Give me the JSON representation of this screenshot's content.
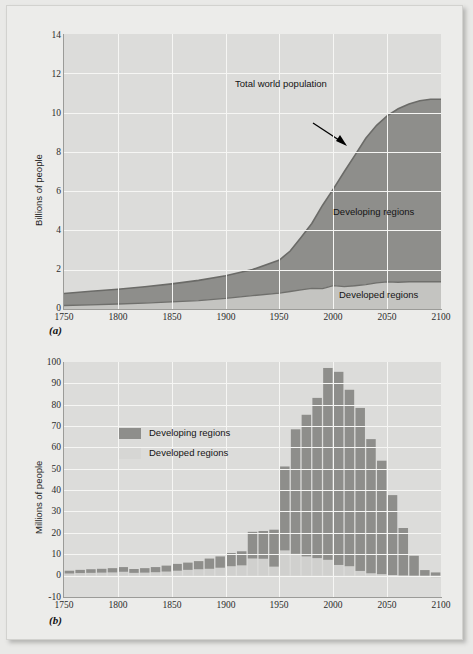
{
  "figure": {
    "background_color": "#e9e9e7",
    "panel_background": "#dcdcda",
    "gridline_color": "#f6f6f4",
    "developing_color": "#8e8e8b",
    "developed_color": "#d0d0ce",
    "line_color": "#6f6f6c"
  },
  "panel_a": {
    "label": "(a)",
    "ylabel": "Billions of people",
    "yticks": [
      "0",
      "2",
      "4",
      "6",
      "8",
      "10",
      "12",
      "14"
    ],
    "xticks": [
      "1750",
      "1800",
      "1850",
      "1900",
      "1950",
      "2000",
      "2050",
      "2100"
    ],
    "annotations": {
      "total": "Total world population",
      "developing": "Developing regions",
      "developed": "Developed regions"
    }
  },
  "panel_b": {
    "label": "(b)",
    "ylabel": "Millions of people",
    "yticks": [
      "-10",
      "0",
      "10",
      "20",
      "30",
      "40",
      "50",
      "60",
      "70",
      "80",
      "90",
      "100"
    ],
    "xticks": [
      "1750",
      "1800",
      "1850",
      "1900",
      "1950",
      "2000",
      "2050",
      "2100"
    ],
    "legend": [
      {
        "label": "Developing regions",
        "color": "#8e8e8b"
      },
      {
        "label": "Developed regions",
        "color": "#d0d0ce"
      }
    ]
  },
  "chart_data": [
    {
      "id": "panel_a",
      "type": "area",
      "stacked": true,
      "title": "",
      "xlabel": "",
      "ylabel": "Billions of people",
      "xlim": [
        1750,
        2100
      ],
      "ylim": [
        0,
        14
      ],
      "ytick_values": [
        0,
        2,
        4,
        6,
        8,
        10,
        12,
        14
      ],
      "xtick_values": [
        1750,
        1800,
        1850,
        1900,
        1950,
        2000,
        2050,
        2100
      ],
      "grid": true,
      "legend": "none",
      "annotations": [
        {
          "text": "Total world population",
          "x": 2000,
          "y": 11.9,
          "arrow_to_x": 2018,
          "arrow_to_y": 10.0
        },
        {
          "text": "Developing regions",
          "x": 2035,
          "y": 5.0
        },
        {
          "text": "Developed regions",
          "x": 2045,
          "y": 0.6
        }
      ],
      "x": [
        1750,
        1775,
        1800,
        1825,
        1850,
        1875,
        1900,
        1925,
        1950,
        1960,
        1970,
        1980,
        1990,
        2000,
        2010,
        2020,
        2030,
        2040,
        2050,
        2060,
        2070,
        2080,
        2090,
        2100
      ],
      "series": [
        {
          "name": "Developed regions",
          "values": [
            0.18,
            0.21,
            0.25,
            0.3,
            0.36,
            0.43,
            0.54,
            0.68,
            0.81,
            0.89,
            0.97,
            1.05,
            1.14,
            1.19,
            1.24,
            1.29,
            1.33,
            1.36,
            1.38,
            1.39,
            1.39,
            1.39,
            1.39,
            1.39
          ]
        },
        {
          "name": "Developing regions",
          "values": [
            0.61,
            0.69,
            0.76,
            0.83,
            0.92,
            1.03,
            1.16,
            1.33,
            1.69,
            2.07,
            2.68,
            3.31,
            4.15,
            4.93,
            5.75,
            6.55,
            7.37,
            8.0,
            8.47,
            8.81,
            9.05,
            9.22,
            9.3,
            9.3
          ]
        }
      ],
      "total_series": {
        "name": "Total world population",
        "values": [
          0.79,
          0.9,
          1.01,
          1.13,
          1.28,
          1.46,
          1.7,
          2.01,
          2.5,
          2.96,
          3.65,
          4.36,
          5.29,
          6.12,
          6.99,
          7.84,
          8.7,
          9.36,
          9.85,
          10.2,
          10.44,
          10.61,
          10.69,
          10.69
        ]
      }
    },
    {
      "id": "panel_b",
      "type": "bar",
      "stacked": true,
      "title": "",
      "xlabel": "",
      "ylabel": "Millions of people",
      "xlim": [
        1750,
        2100
      ],
      "ylim": [
        -10,
        100
      ],
      "ytick_values": [
        -10,
        0,
        10,
        20,
        30,
        40,
        50,
        60,
        70,
        80,
        90,
        100
      ],
      "xtick_values": [
        1750,
        1800,
        1850,
        1900,
        1950,
        2000,
        2050,
        2100
      ],
      "grid": true,
      "legend_position": "upper-left-inside",
      "categories": [
        1755,
        1765,
        1775,
        1785,
        1795,
        1805,
        1815,
        1825,
        1835,
        1845,
        1855,
        1865,
        1875,
        1885,
        1895,
        1905,
        1915,
        1925,
        1935,
        1945,
        1955,
        1965,
        1975,
        1985,
        1995,
        2005,
        2015,
        2025,
        2035,
        2045,
        2055,
        2065,
        2075,
        2085,
        2095
      ],
      "series": [
        {
          "name": "Developed regions",
          "values": [
            1.0,
            1.2,
            1.3,
            1.4,
            1.5,
            1.8,
            1.3,
            1.4,
            1.6,
            1.9,
            2.3,
            2.7,
            3.0,
            3.2,
            3.7,
            4.4,
            4.8,
            8.0,
            7.9,
            4.2,
            11.8,
            10.2,
            9.0,
            8.2,
            7.4,
            5.0,
            4.4,
            2.2,
            1.1,
            0.7,
            0.3,
            0.1,
            0.0,
            -0.6,
            -1.0
          ]
        },
        {
          "name": "Developing regions",
          "values": [
            1.3,
            1.5,
            1.7,
            1.8,
            2.0,
            2.2,
            1.8,
            2.1,
            2.4,
            2.8,
            3.2,
            3.4,
            3.8,
            4.8,
            5.3,
            6.2,
            6.6,
            12.5,
            13.0,
            17.3,
            39.3,
            58.3,
            66.3,
            75.0,
            89.8,
            90.4,
            82.6,
            76.3,
            62.8,
            53.1,
            37.4,
            22.2,
            9.3,
            2.6,
            1.5
          ]
        }
      ],
      "totals": [
        2.3,
        2.7,
        3.0,
        3.2,
        3.5,
        4.0,
        3.1,
        3.5,
        4.0,
        4.7,
        5.5,
        6.1,
        6.8,
        8.0,
        9.0,
        10.6,
        11.4,
        20.5,
        20.9,
        21.5,
        51.1,
        68.5,
        75.3,
        83.2,
        97.2,
        95.4,
        87.0,
        78.5,
        63.9,
        53.8,
        37.7,
        22.3,
        9.3,
        2.0,
        0.5
      ]
    }
  ]
}
